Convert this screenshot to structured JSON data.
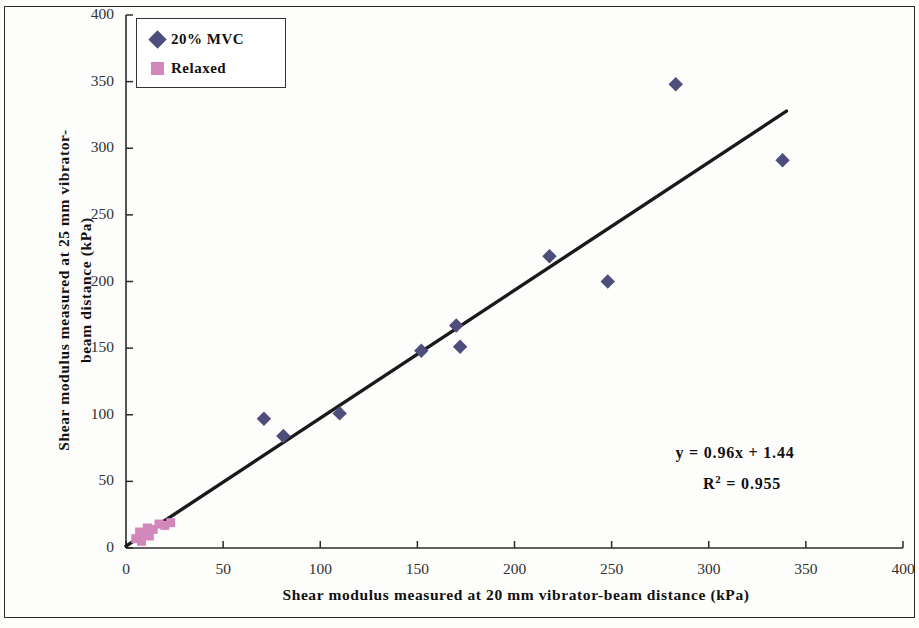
{
  "chart_data": {
    "type": "scatter",
    "title": "",
    "xlabel": "Shear modulus measured at 20 mm vibrator-beam distance (kPa)",
    "ylabel_line1": "Shear modulus measured at 25 mm vibrator-",
    "ylabel_line2": "beam distance (kPa)",
    "xlim": [
      0,
      400
    ],
    "ylim": [
      0,
      400
    ],
    "xticks": [
      "0",
      "50",
      "100",
      "150",
      "200",
      "250",
      "300",
      "350",
      "400"
    ],
    "yticks": [
      "0",
      "50",
      "100",
      "150",
      "200",
      "250",
      "300",
      "350",
      "400"
    ],
    "xtick_values": [
      0,
      50,
      100,
      150,
      200,
      250,
      300,
      350,
      400
    ],
    "ytick_values": [
      0,
      50,
      100,
      150,
      200,
      250,
      300,
      350,
      400
    ],
    "grid": false,
    "legend_position": "top-left",
    "series": [
      {
        "name": "20% MVC",
        "marker": "diamond",
        "color": "#4e4e7d",
        "points": [
          [
            71,
            97
          ],
          [
            81,
            84
          ],
          [
            110,
            101
          ],
          [
            152,
            148
          ],
          [
            170,
            167
          ],
          [
            172,
            151
          ],
          [
            218,
            219
          ],
          [
            248,
            200
          ],
          [
            283,
            348
          ],
          [
            338,
            291
          ]
        ]
      },
      {
        "name": "Relaxed",
        "marker": "square",
        "color": "#d287bb",
        "points": [
          [
            5,
            7
          ],
          [
            7,
            12
          ],
          [
            9,
            10
          ],
          [
            11,
            15
          ],
          [
            14,
            14
          ],
          [
            17,
            18
          ],
          [
            20,
            17
          ],
          [
            23,
            19
          ],
          [
            8,
            5
          ],
          [
            12,
            9
          ]
        ]
      }
    ],
    "trendline": {
      "equation": "y = 0.96x + 1.44",
      "r_squared_label": "R",
      "r_squared_sup": "2",
      "r_squared_value": " = 0.955",
      "slope": 0.96,
      "intercept": 1.44,
      "r2": 0.955,
      "x_start": 0,
      "x_end": 340,
      "color": "#1a1a1a"
    }
  },
  "legend": {
    "items": [
      {
        "label": "20% MVC",
        "color": "#4e4e7d",
        "marker": "diamond"
      },
      {
        "label": "Relaxed",
        "color": "#d287bb",
        "marker": "square"
      }
    ]
  },
  "annotation": {
    "equation": "y = 0.96x + 1.44",
    "r2_prefix": "R",
    "r2_exponent": "2",
    "r2_suffix": " = 0.955"
  },
  "colors": {
    "mvc_marker": "#4e4e7d",
    "relaxed_marker": "#d287bb",
    "trendline": "#1a1a1a",
    "axis": "#2b2b2b",
    "background": "#fdfdfc"
  }
}
